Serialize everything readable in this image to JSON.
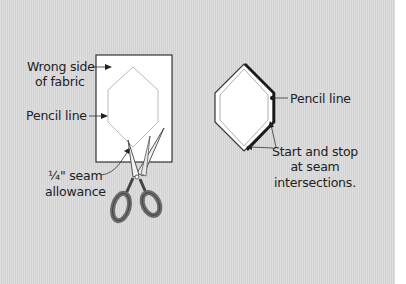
{
  "colors": {
    "background": "#dadada",
    "fabric": "#ffffff",
    "outline": "#333333",
    "pencil_line": "#bbbbbb",
    "scissor_handle": "#6b6b6b",
    "text": "#222222"
  },
  "left_figure": {
    "labels": {
      "wrong_side_line1": "Wrong side",
      "wrong_side_line2": "of fabric",
      "pencil_line": "Pencil line",
      "seam_line1": "¼\" seam",
      "seam_line2": "allowance"
    },
    "icons": [
      "fabric-rectangle",
      "hexagon-pencil-outline",
      "scissors-icon"
    ]
  },
  "right_figure": {
    "labels": {
      "pencil_line": "Pencil line",
      "start_stop_line1": "Start and stop",
      "start_stop_line2": "at seam",
      "start_stop_line3": "intersections."
    },
    "icons": [
      "hexagon-fabric-piece",
      "stitching-line"
    ]
  }
}
